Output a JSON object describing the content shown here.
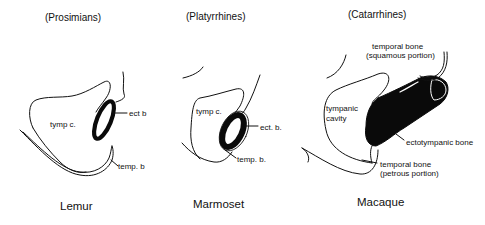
{
  "panels": [
    {
      "group": "(Prosimians)",
      "species": "Lemur",
      "labels": {
        "cavity": "tymp c.",
        "ecto": "ect  b",
        "temporal": "temp. b"
      }
    },
    {
      "group": "(Platyrrhines)",
      "species": "Marmoset",
      "labels": {
        "cavity": "tymp c.",
        "ecto": "ect. b.",
        "temporal": "temp. b."
      }
    },
    {
      "group": "(Catarrhines)",
      "species": "Macaque",
      "labels": {
        "squamous_1": "temporal bone",
        "squamous_2": "(squamous portion)",
        "cavity_1": "tympanic",
        "cavity_2": "cavity",
        "ecto": "ectotympanic bone",
        "petrous_1": "temporal bone",
        "petrous_2": "(petrous portion)"
      }
    }
  ],
  "colors": {
    "line": "#111111",
    "bone_fill": "#0a0a0a",
    "background": "#ffffff"
  }
}
